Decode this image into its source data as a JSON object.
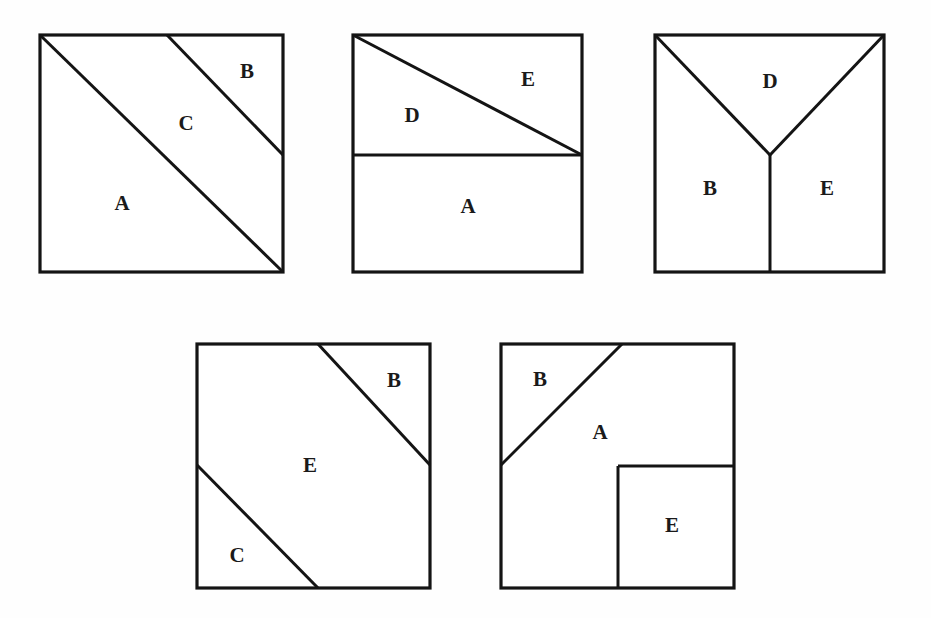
{
  "figure": {
    "background_color": "#fefefe",
    "line_color": "#141414",
    "label_color": "#1a1a1a",
    "canvas": {
      "width": 931,
      "height": 618
    },
    "squares": [
      {
        "id": "square-1",
        "name": "square-a-c-b-double-diagonal",
        "frame": {
          "x": 40,
          "y": 35,
          "width": 243,
          "height": 237
        },
        "cuts": [
          {
            "name": "main-diagonal",
            "x1": 40,
            "y1": 35,
            "x2": 283,
            "y2": 272
          },
          {
            "name": "upper-parallel-diagonal",
            "x1": 167,
            "y1": 35,
            "x2": 283,
            "y2": 155
          }
        ],
        "labels": [
          {
            "text": "B",
            "x": 247,
            "y": 73
          },
          {
            "text": "C",
            "x": 186,
            "y": 125
          },
          {
            "text": "A",
            "x": 122,
            "y": 205
          }
        ]
      },
      {
        "id": "square-2",
        "name": "square-d-e-a-horizontal-and-diagonal",
        "frame": {
          "x": 353,
          "y": 35,
          "width": 229,
          "height": 237
        },
        "cuts": [
          {
            "name": "horizontal-divider",
            "x1": 353,
            "y1": 155,
            "x2": 582,
            "y2": 155
          },
          {
            "name": "upper-diagonal",
            "x1": 353,
            "y1": 35,
            "x2": 582,
            "y2": 155
          }
        ],
        "labels": [
          {
            "text": "E",
            "x": 528,
            "y": 81
          },
          {
            "text": "D",
            "x": 412,
            "y": 117
          },
          {
            "text": "A",
            "x": 468,
            "y": 208
          }
        ]
      },
      {
        "id": "square-3",
        "name": "square-d-b-e-y-junction",
        "frame": {
          "x": 655,
          "y": 35,
          "width": 229,
          "height": 237
        },
        "cuts": [
          {
            "name": "left-v-arm",
            "x1": 655,
            "y1": 35,
            "x2": 770,
            "y2": 155
          },
          {
            "name": "right-v-arm",
            "x1": 884,
            "y1": 35,
            "x2": 770,
            "y2": 155
          },
          {
            "name": "vertical-stem",
            "x1": 770,
            "y1": 155,
            "x2": 770,
            "y2": 272
          }
        ],
        "labels": [
          {
            "text": "D",
            "x": 770,
            "y": 83
          },
          {
            "text": "B",
            "x": 710,
            "y": 190
          },
          {
            "text": "E",
            "x": 827,
            "y": 190
          }
        ]
      },
      {
        "id": "square-4",
        "name": "square-b-e-c-two-parallel-corner-cuts",
        "frame": {
          "x": 197,
          "y": 344,
          "width": 233,
          "height": 244
        },
        "cuts": [
          {
            "name": "upper-right-corner-cut",
            "x1": 318,
            "y1": 344,
            "x2": 430,
            "y2": 465
          },
          {
            "name": "lower-left-corner-cut",
            "x1": 197,
            "y1": 465,
            "x2": 318,
            "y2": 588
          }
        ],
        "labels": [
          {
            "text": "B",
            "x": 394,
            "y": 382
          },
          {
            "text": "E",
            "x": 310,
            "y": 467
          },
          {
            "text": "C",
            "x": 237,
            "y": 557
          }
        ]
      },
      {
        "id": "square-5",
        "name": "square-b-a-e-corner-cut-and-inner-square",
        "frame": {
          "x": 501,
          "y": 344,
          "width": 233,
          "height": 244
        },
        "cuts": [
          {
            "name": "upper-left-corner-cut",
            "x1": 501,
            "y1": 465,
            "x2": 622,
            "y2": 344
          },
          {
            "name": "inner-square-top-edge",
            "x1": 618,
            "y1": 466,
            "x2": 734,
            "y2": 466
          },
          {
            "name": "inner-square-left-edge",
            "x1": 618,
            "y1": 466,
            "x2": 618,
            "y2": 588
          }
        ],
        "labels": [
          {
            "text": "B",
            "x": 540,
            "y": 381
          },
          {
            "text": "A",
            "x": 600,
            "y": 434
          },
          {
            "text": "E",
            "x": 672,
            "y": 527
          }
        ]
      }
    ]
  }
}
